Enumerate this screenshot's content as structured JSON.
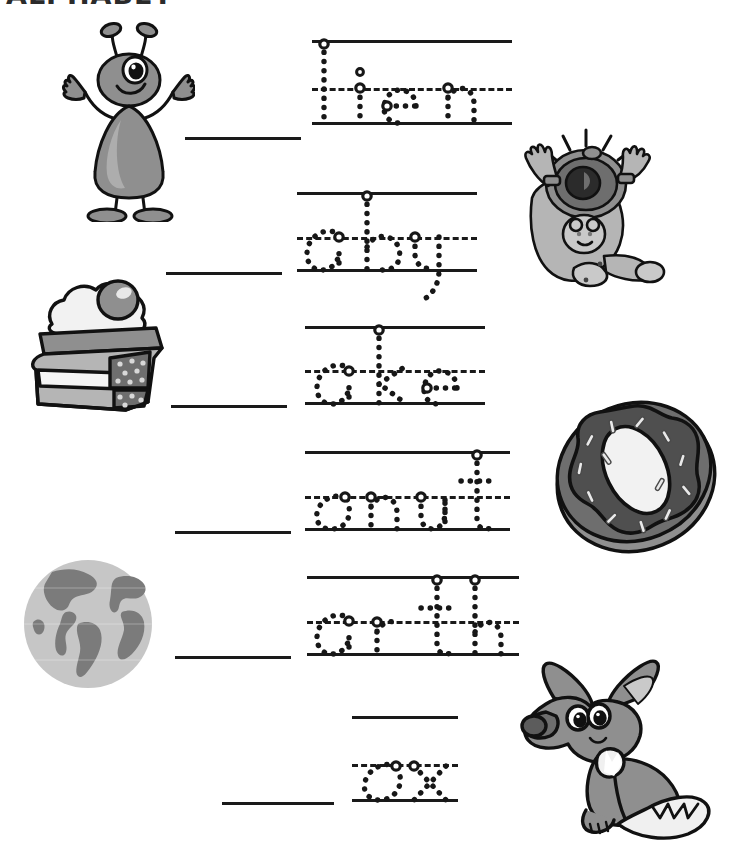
{
  "page": {
    "title": "ALPHABET",
    "background_color": "#ffffff",
    "ink_color": "#1a1a1a",
    "art_gray_dark": "#6e6e6e",
    "art_gray_mid": "#8f8f8f",
    "art_gray_light": "#b5b5b5",
    "art_gray_pale": "#d8d8d8"
  },
  "rows": [
    {
      "id": "row-alien",
      "answer_letter": "A",
      "word": "ALIEN",
      "trace_text": "lien",
      "picture_name": "alien-illustration",
      "picture_side": "left",
      "blank": {
        "x": 185,
        "y": 137,
        "width": 116
      },
      "guide": {
        "x": 312,
        "y": 40,
        "width": 200,
        "height": 85,
        "mid_ratio": 0.56
      }
    },
    {
      "id": "row-baby",
      "answer_letter": "B",
      "word": "BABY",
      "trace_text": "aby",
      "picture_name": "baby-illustration",
      "picture_side": "right",
      "blank": {
        "x": 166,
        "y": 272,
        "width": 116
      },
      "guide": {
        "x": 297,
        "y": 192,
        "width": 180,
        "height": 80,
        "mid_ratio": 0.56
      }
    },
    {
      "id": "row-cake",
      "answer_letter": "C",
      "word": "CAKE",
      "trace_text": "ake",
      "picture_name": "cake-illustration",
      "picture_side": "left",
      "blank": {
        "x": 171,
        "y": 405,
        "width": 116
      },
      "guide": {
        "x": 305,
        "y": 326,
        "width": 180,
        "height": 79,
        "mid_ratio": 0.56
      }
    },
    {
      "id": "row-donut",
      "answer_letter": "D",
      "word": "DONUT",
      "trace_text": "onut",
      "picture_name": "donut-illustration",
      "picture_side": "right",
      "blank": {
        "x": 175,
        "y": 531,
        "width": 116
      },
      "guide": {
        "x": 305,
        "y": 451,
        "width": 205,
        "height": 80,
        "mid_ratio": 0.56
      }
    },
    {
      "id": "row-earth",
      "answer_letter": "E",
      "word": "EARTH",
      "trace_text": "arth",
      "picture_name": "earth-illustration",
      "picture_side": "left",
      "blank": {
        "x": 175,
        "y": 656,
        "width": 116
      },
      "guide": {
        "x": 307,
        "y": 576,
        "width": 212,
        "height": 80,
        "mid_ratio": 0.56
      }
    },
    {
      "id": "row-fox",
      "answer_letter": "F",
      "word": "FOX",
      "trace_text": "ox",
      "picture_name": "fox-illustration",
      "picture_side": "right",
      "blank": {
        "x": 222,
        "y": 802,
        "width": 112
      },
      "guide": {
        "x": 352,
        "y": 716,
        "width": 106,
        "height": 86,
        "mid_ratio": 0.56
      }
    }
  ],
  "pictures": {
    "alien": {
      "name": "alien-illustration",
      "x": 55,
      "y": 22,
      "width": 140,
      "height": 200,
      "alt": "one-eyed alien waving"
    },
    "baby": {
      "name": "baby-illustration",
      "x": 508,
      "y": 128,
      "width": 160,
      "height": 162,
      "alt": "crying baby in onesie"
    },
    "cake": {
      "name": "cake-illustration",
      "x": 22,
      "y": 262,
      "width": 152,
      "height": 150,
      "alt": "slice of layer cake with cherry"
    },
    "donut": {
      "name": "donut-illustration",
      "x": 548,
      "y": 392,
      "width": 175,
      "height": 165,
      "alt": "frosted donut with sprinkles"
    },
    "earth": {
      "name": "earth-illustration",
      "x": 22,
      "y": 558,
      "width": 132,
      "height": 132,
      "alt": "globe showing the Americas"
    },
    "fox": {
      "name": "fox-illustration",
      "x": 502,
      "y": 652,
      "width": 232,
      "height": 195,
      "alt": "sitting fox with bushy tail"
    }
  }
}
